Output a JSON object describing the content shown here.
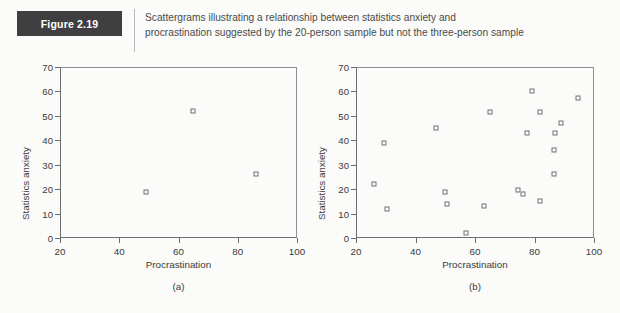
{
  "figure": {
    "badge_label": "Figure 2.19",
    "caption_line1": "Scattergrams illustrating a relationship between statistics anxiety and",
    "caption_line2": "procrastination suggested by the 20-person sample but not the three-person sample",
    "badge_bg": "#3f3f42",
    "badge_text_color": "#ffffff",
    "page_bg": "#fbfbf9",
    "marker_color": "#6f6f72",
    "axis_color": "#6c6c6c"
  },
  "chart_data": [
    {
      "type": "scatter",
      "panel": "(a)",
      "title": "",
      "xlabel": "Procrastination",
      "ylabel": "Statistics anxiety",
      "xlim": [
        20,
        100
      ],
      "ylim": [
        0,
        70
      ],
      "xticks": [
        20,
        40,
        60,
        80,
        100
      ],
      "yticks": [
        0,
        10,
        20,
        30,
        40,
        50,
        60,
        70
      ],
      "grid": false,
      "legend": null,
      "marker": "open-square",
      "n": 3,
      "points": [
        {
          "x": 49,
          "y": 19
        },
        {
          "x": 65,
          "y": 52
        },
        {
          "x": 86,
          "y": 26
        }
      ]
    },
    {
      "type": "scatter",
      "panel": "(b)",
      "title": "",
      "xlabel": "Procrastination",
      "ylabel": "Statistics anxiety",
      "xlim": [
        20,
        100
      ],
      "ylim": [
        0,
        70
      ],
      "xticks": [
        20,
        40,
        60,
        80,
        100
      ],
      "yticks": [
        0,
        10,
        20,
        30,
        40,
        50,
        60,
        70
      ],
      "grid": false,
      "legend": null,
      "marker": "open-square",
      "n": 20,
      "points": [
        {
          "x": 26,
          "y": 22
        },
        {
          "x": 29.5,
          "y": 39
        },
        {
          "x": 30.5,
          "y": 12
        },
        {
          "x": 47,
          "y": 45
        },
        {
          "x": 50,
          "y": 19
        },
        {
          "x": 50.5,
          "y": 14
        },
        {
          "x": 57,
          "y": 2
        },
        {
          "x": 63,
          "y": 13
        },
        {
          "x": 65,
          "y": 51.5
        },
        {
          "x": 74.5,
          "y": 19.5
        },
        {
          "x": 76,
          "y": 18
        },
        {
          "x": 77.5,
          "y": 43
        },
        {
          "x": 79,
          "y": 60
        },
        {
          "x": 82,
          "y": 15
        },
        {
          "x": 82,
          "y": 51.5
        },
        {
          "x": 86.5,
          "y": 26
        },
        {
          "x": 86.5,
          "y": 36
        },
        {
          "x": 87,
          "y": 43
        },
        {
          "x": 89,
          "y": 47
        },
        {
          "x": 94.5,
          "y": 57.5
        }
      ]
    }
  ]
}
